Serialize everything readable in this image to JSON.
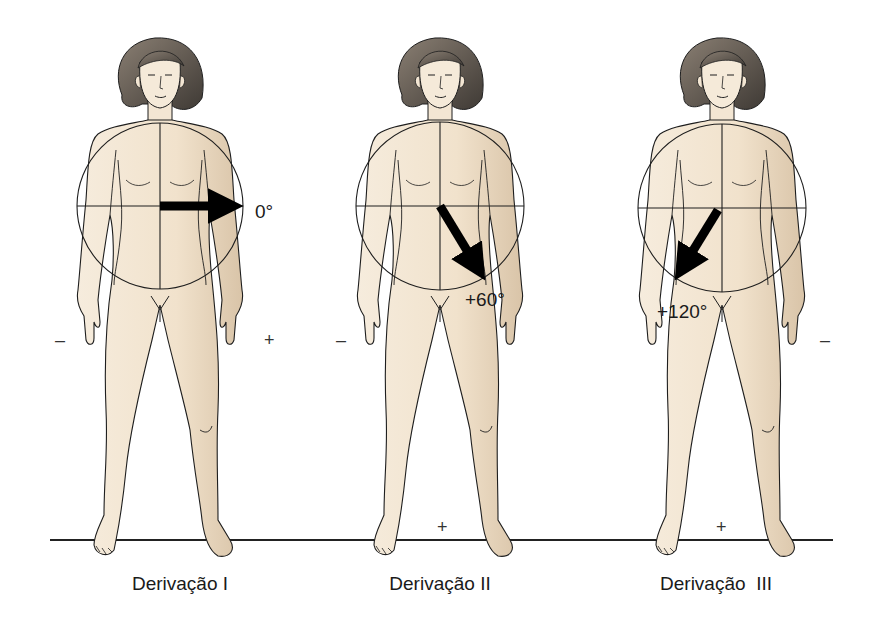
{
  "diagram": {
    "type": "anatomical-ecg-limb-leads",
    "colors": {
      "skin": "#f3e6d3",
      "skin_shade": "#d9c4a8",
      "hair": "#6e645a",
      "hair_dark": "#3f3a35",
      "outline": "#1e1e1e",
      "arrow": "#000000",
      "ground_line": "#222222",
      "text": "#1a1a1a"
    },
    "ground_line": {
      "x1": 50,
      "x2": 833,
      "y": 540
    },
    "figures": [
      {
        "id": "lead-1",
        "caption": "Derivação I",
        "angle_label": "0°",
        "angle_deg": 0,
        "center_x": 160,
        "negative_sign": "–",
        "positive_sign": "+",
        "negative_pos": {
          "x": 58,
          "y": 345
        },
        "positive_pos": {
          "x": 270,
          "y": 345
        },
        "angle_label_pos": {
          "x": 255,
          "y": 218
        },
        "caption_pos": {
          "x": 180,
          "y": 588
        }
      },
      {
        "id": "lead-2",
        "caption": "Derivação II",
        "angle_label": "+60°",
        "angle_deg": 60,
        "center_x": 440,
        "negative_sign": "–",
        "positive_sign": "+",
        "negative_pos": {
          "x": 340,
          "y": 345
        },
        "positive_pos": {
          "x": 444,
          "y": 532
        },
        "angle_label_pos": {
          "x": 465,
          "y": 306
        },
        "caption_pos": {
          "x": 440,
          "y": 588
        }
      },
      {
        "id": "lead-3",
        "caption": "Derivação  III",
        "angle_label": "+120°",
        "angle_deg": 120,
        "center_x": 722,
        "negative_sign": "–",
        "positive_sign": "+",
        "negative_pos": {
          "x": 826,
          "y": 345
        },
        "positive_pos": {
          "x": 722,
          "y": 532
        },
        "angle_label_pos": {
          "x": 658,
          "y": 318
        },
        "caption_pos": {
          "x": 722,
          "y": 588
        }
      }
    ]
  }
}
